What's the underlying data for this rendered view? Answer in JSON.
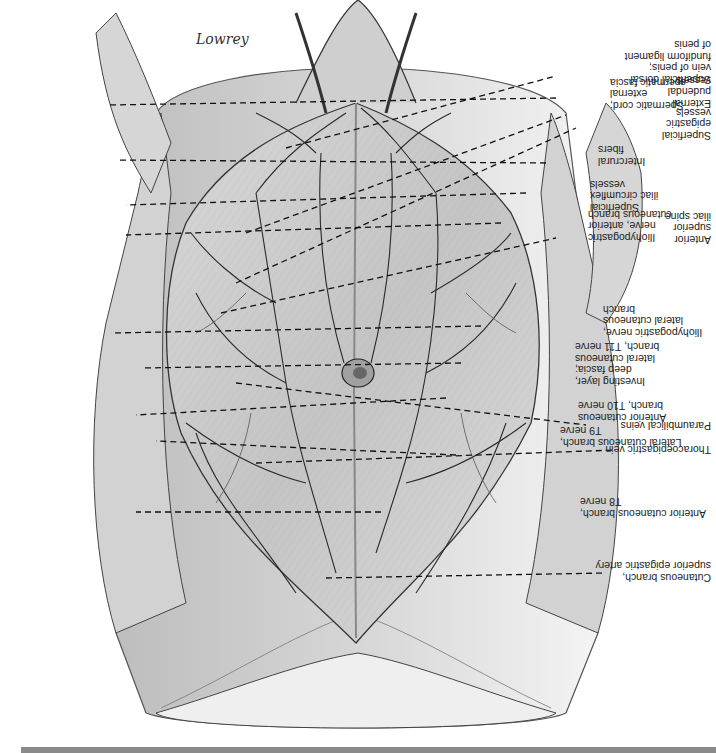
{
  "figure": {
    "orientation": "rotated 180 degrees",
    "signature": "Lowrey",
    "colors": {
      "background": "#ffffff",
      "line": "#1a1a1a",
      "bar": "#8a8a8a",
      "skin_light": "#e8e8e8",
      "skin_mid": "#c8c8c8",
      "skin_dark": "#9a9a9a"
    }
  },
  "labels": {
    "right_side": [
      {
        "id": "anterior-cutaneous-t8",
        "text": "Anterior cutaneous branch,\nT8 nerve"
      },
      {
        "id": "lateral-cutaneous-t9",
        "text": "Lateral cutaneous branch,\nT9 nerve"
      },
      {
        "id": "anterior-cutaneous-t10",
        "text": "Anterior cutaneous\nbranch, T10 nerve"
      },
      {
        "id": "investing-layer",
        "text": "Investing layer,\ndeep fascia;\nlateral cutaneous\nbranch, T11 nerve"
      },
      {
        "id": "iliohypogastric-lateral",
        "text": "Iliohypogastric nerve,\nlateral cutaneous\nbranch"
      },
      {
        "id": "iliohypogastric-anterior",
        "text": "Iliohypogastric\nnerve, anterior\ncutaneous branch"
      },
      {
        "id": "superficial-circumflex-iliac",
        "text": "Superficial\niliac circumflex\nvessels"
      },
      {
        "id": "intercrural-fibers",
        "text": "Intercrural\nfibers"
      },
      {
        "id": "spermatic-cord",
        "text": "Spermatic cord;\nexternal\nspermatic fascia"
      }
    ],
    "left_side": [
      {
        "id": "cutaneous-superior-epigastric",
        "text": "Cutaneous branch,\nsuperior epigastric artery"
      },
      {
        "id": "thoracoepigastric-vein",
        "text": "Thoracoepigastric vein"
      },
      {
        "id": "paraumbilical-veins",
        "text": "Paraumbilical veins"
      },
      {
        "id": "anterior-superior-iliac-spine",
        "text": "Anterior\nsuperior\niliac spine"
      },
      {
        "id": "superficial-epigastric",
        "text": "Superficial\nepigastric\nvessels"
      },
      {
        "id": "external-pudendal",
        "text": "External\npudendal\nvessels"
      },
      {
        "id": "superficial-dorsal-vein",
        "text": "Superficial dorsal\nvein of penis;\nfundiform ligament\nof penis"
      }
    ]
  }
}
